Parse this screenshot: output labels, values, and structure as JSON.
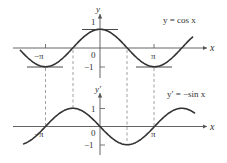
{
  "figure": {
    "top_graph": {
      "equation_label": "y = cos x",
      "x_axis_label": "x",
      "y_axis_label": "y",
      "x_ticks": [
        {
          "label": "−π",
          "value": -3.14159
        },
        {
          "label": "0",
          "value": 0
        },
        {
          "label": "π",
          "value": 3.14159
        }
      ],
      "y_ticks": [
        {
          "label": "1",
          "value": 1
        },
        {
          "label": "−1",
          "value": -1
        }
      ],
      "function": "cos"
    },
    "bottom_graph": {
      "equation_label": "y′ = −sin x",
      "x_axis_label": "x",
      "y_axis_label": "y′",
      "x_ticks": [
        {
          "label": "−π",
          "value": -3.14159
        },
        {
          "label": "0",
          "value": 0
        },
        {
          "label": "π",
          "value": 3.14159
        }
      ],
      "y_ticks": [
        {
          "label": "1",
          "value": 1
        },
        {
          "label": "−1",
          "value": -1
        }
      ],
      "function": "-sin"
    },
    "dashed_guides_at_x": [
      "−π",
      "−π/2",
      "π/2",
      "π"
    ],
    "colors": {
      "curve": "#333333",
      "axes": "#555555",
      "guides": "#888888",
      "text": "#333333"
    }
  }
}
